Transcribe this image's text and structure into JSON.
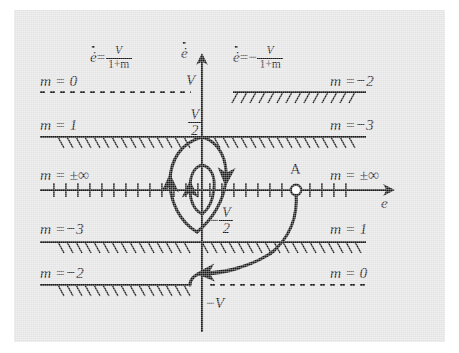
{
  "figure": {
    "background": "#e3e3e3",
    "ink": "#1a1a1a",
    "axes": {
      "x_label": "e",
      "y_label": "ė",
      "x_axis_name": "error axis",
      "y_axis_name": "error-rate axis"
    },
    "equations": {
      "left": {
        "lhs": "ė",
        "eq": "=",
        "num": "V",
        "den": "1+m",
        "sign": ""
      },
      "right": {
        "lhs": "ė",
        "eq": "=",
        "num": "V",
        "den": "1+m",
        "sign": "−"
      }
    },
    "y_ticks": [
      {
        "label": "V",
        "name": "tick-V"
      },
      {
        "label": "V/2",
        "num": "V",
        "den": "2",
        "sign": "",
        "name": "tick-V-over-2"
      },
      {
        "label": "-V/2",
        "num": "V",
        "den": "2",
        "sign": "−",
        "name": "tick-neg-V-over-2"
      },
      {
        "label": "−V",
        "name": "tick-neg-V"
      }
    ],
    "switching_lines": [
      {
        "id": "line-V",
        "level": "V",
        "left_label": "m = 0",
        "right_label": "m =−2",
        "left_style": "dashed",
        "right_style": "hatched",
        "hatch_dir": "back",
        "hatch_side": "down"
      },
      {
        "id": "line-half-V",
        "level": "V/2",
        "left_label": "m = 1",
        "right_label": "m =−3",
        "left_style": "hatched",
        "right_style": "hatched",
        "hatch_dir": "fwd",
        "hatch_side": "down"
      },
      {
        "id": "line-zero",
        "level": "0",
        "left_label": "m = ±∞",
        "right_label": "m = ±∞",
        "left_style": "ticked",
        "right_style": "ticked",
        "hatch_dir": "vert",
        "hatch_side": "both"
      },
      {
        "id": "line-neg-half-V",
        "level": "-V/2",
        "left_label": "m =−3",
        "right_label": "m = 1",
        "left_style": "hatched",
        "right_style": "hatched",
        "hatch_dir": "fwd",
        "hatch_side": "down"
      },
      {
        "id": "line-neg-V",
        "level": "-V",
        "left_label": "m =−2",
        "right_label": "m = 0",
        "left_style": "hatched",
        "right_style": "dashed",
        "hatch_dir": "fwd",
        "hatch_side": "down"
      }
    ],
    "points": [
      {
        "label": "A",
        "name": "point-a",
        "marker": "open-circle"
      }
    ],
    "trajectories": [
      {
        "name": "trajectory-from-a",
        "description": "curve descending from point A, sweeping left"
      },
      {
        "name": "outer-limit-cycle",
        "description": "large closed orbit around origin, clockwise"
      },
      {
        "name": "inner-limit-cycle",
        "description": "small closed orbit around origin, clockwise"
      }
    ]
  }
}
